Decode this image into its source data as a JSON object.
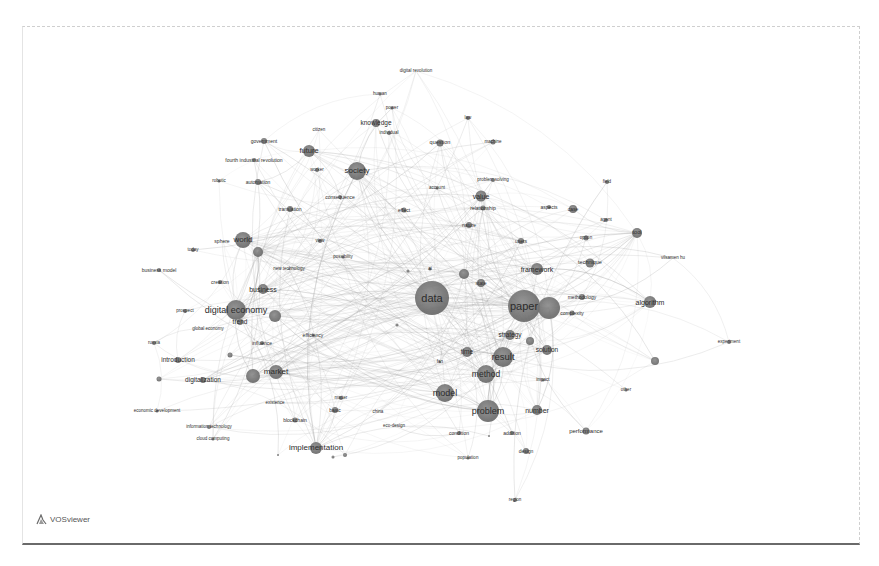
{
  "app": {
    "logo_text": "VOSviewer"
  },
  "network": {
    "nodes": [
      {
        "label": "digital revolution",
        "x": 416,
        "y": 71,
        "r": 0,
        "fs": 4.5
      },
      {
        "label": "human",
        "x": 380,
        "y": 94,
        "r": 1.5,
        "fs": 4.5
      },
      {
        "label": "power",
        "x": 392,
        "y": 108,
        "r": 1.5,
        "fs": 4.5
      },
      {
        "label": "law",
        "x": 468,
        "y": 118,
        "r": 2,
        "fs": 4.5
      },
      {
        "label": "knowledge",
        "x": 376,
        "y": 123,
        "r": 4,
        "fs": 6.5
      },
      {
        "label": "individual",
        "x": 389,
        "y": 133,
        "r": 2,
        "fs": 4.5
      },
      {
        "label": "citizen",
        "x": 319,
        "y": 130,
        "r": 0,
        "fs": 4.5
      },
      {
        "label": "government",
        "x": 264,
        "y": 141,
        "r": 3,
        "fs": 5
      },
      {
        "label": "question",
        "x": 440,
        "y": 143,
        "r": 3.5,
        "fs": 5.5
      },
      {
        "label": "machine",
        "x": 493,
        "y": 142,
        "r": 2.5,
        "fs": 4.5
      },
      {
        "label": "future",
        "x": 309,
        "y": 151,
        "r": 6,
        "fs": 7.5
      },
      {
        "label": "fourth industrial revolution",
        "x": 254,
        "y": 160,
        "r": 2,
        "fs": 5
      },
      {
        "label": "society",
        "x": 357,
        "y": 171,
        "r": 9,
        "fs": 8
      },
      {
        "label": "worker",
        "x": 317,
        "y": 170,
        "r": 2,
        "fs": 4.5
      },
      {
        "label": "robotic",
        "x": 219,
        "y": 181,
        "r": 1.5,
        "fs": 4.5
      },
      {
        "label": "automation",
        "x": 258,
        "y": 182,
        "r": 3,
        "fs": 5
      },
      {
        "label": "account",
        "x": 437,
        "y": 188,
        "r": 1.5,
        "fs": 4.5
      },
      {
        "label": "problem solving",
        "x": 493,
        "y": 180,
        "r": 2,
        "fs": 4.5
      },
      {
        "label": "consequence",
        "x": 340,
        "y": 197,
        "r": 2,
        "fs": 5
      },
      {
        "label": "value",
        "x": 481,
        "y": 196,
        "r": 5.5,
        "fs": 7
      },
      {
        "label": "relationship",
        "x": 483,
        "y": 208,
        "r": 2.5,
        "fs": 5
      },
      {
        "label": "effect",
        "x": 404,
        "y": 210,
        "r": 2.5,
        "fs": 5
      },
      {
        "label": "translation",
        "x": 290,
        "y": 209,
        "r": 3,
        "fs": 5
      },
      {
        "label": "aspects",
        "x": 549,
        "y": 207,
        "r": 2,
        "fs": 5
      },
      {
        "label": "case",
        "x": 573,
        "y": 209,
        "r": 4,
        "fs": 5
      },
      {
        "label": "field",
        "x": 607,
        "y": 182,
        "r": 2,
        "fs": 4.5
      },
      {
        "label": "agent",
        "x": 606,
        "y": 220,
        "r": 2,
        "fs": 4.5
      },
      {
        "label": "nature",
        "x": 469,
        "y": 225,
        "r": 3,
        "fs": 5
      },
      {
        "label": "world",
        "x": 243,
        "y": 240,
        "r": 8,
        "fs": 8
      },
      {
        "label": "sphere",
        "x": 222,
        "y": 241,
        "r": 0,
        "fs": 5
      },
      {
        "label": "today",
        "x": 193,
        "y": 250,
        "r": 2,
        "fs": 4.5
      },
      {
        "label": "",
        "x": 258,
        "y": 252,
        "r": 5,
        "fs": 0
      },
      {
        "label": "view",
        "x": 320,
        "y": 241,
        "r": 2,
        "fs": 4.5
      },
      {
        "label": "users",
        "x": 521,
        "y": 241,
        "r": 3,
        "fs": 5
      },
      {
        "label": "option",
        "x": 586,
        "y": 238,
        "r": 2.5,
        "fs": 4.5
      },
      {
        "label": "tool",
        "x": 637,
        "y": 233,
        "r": 5,
        "fs": 5.5
      },
      {
        "label": "possibility",
        "x": 343,
        "y": 257,
        "r": 1.5,
        "fs": 4.5
      },
      {
        "label": "vilsamen hu",
        "x": 673,
        "y": 258,
        "r": 0,
        "fs": 4.5
      },
      {
        "label": "technique",
        "x": 590,
        "y": 263,
        "r": 4.5,
        "fs": 5.5
      },
      {
        "label": "framework",
        "x": 537,
        "y": 269,
        "r": 6,
        "fs": 7
      },
      {
        "label": "business model",
        "x": 159,
        "y": 270,
        "r": 2,
        "fs": 5
      },
      {
        "label": "new technology",
        "x": 289,
        "y": 269,
        "r": 1,
        "fs": 4.5
      },
      {
        "label": "",
        "x": 408,
        "y": 271,
        "r": 1.5,
        "fs": 0
      },
      {
        "label": "",
        "x": 464,
        "y": 274,
        "r": 5,
        "fs": 0
      },
      {
        "label": "ai",
        "x": 430,
        "y": 269,
        "r": 1.5,
        "fs": 4.5
      },
      {
        "label": "creation",
        "x": 220,
        "y": 282,
        "r": 2,
        "fs": 5
      },
      {
        "label": "state",
        "x": 481,
        "y": 283,
        "r": 4,
        "fs": 5
      },
      {
        "label": "business",
        "x": 263,
        "y": 289,
        "r": 5,
        "fs": 7
      },
      {
        "label": "data",
        "x": 432,
        "y": 298,
        "r": 17,
        "fs": 11
      },
      {
        "label": "paper",
        "x": 524,
        "y": 306,
        "r": 16,
        "fs": 11
      },
      {
        "label": "",
        "x": 549,
        "y": 308,
        "r": 11,
        "fs": 0
      },
      {
        "label": "methodology",
        "x": 582,
        "y": 297,
        "r": 3,
        "fs": 5
      },
      {
        "label": "complexity",
        "x": 572,
        "y": 313,
        "r": 2.5,
        "fs": 5
      },
      {
        "label": "algorithm",
        "x": 650,
        "y": 302,
        "r": 6,
        "fs": 7
      },
      {
        "label": "digital economy",
        "x": 236,
        "y": 310,
        "r": 10,
        "fs": 9
      },
      {
        "label": "",
        "x": 275,
        "y": 316,
        "r": 6,
        "fs": 0
      },
      {
        "label": "prospect",
        "x": 185,
        "y": 311,
        "r": 2,
        "fs": 4.5
      },
      {
        "label": "trend",
        "x": 240,
        "y": 322,
        "r": 3,
        "fs": 6.5
      },
      {
        "label": "global economy",
        "x": 208,
        "y": 329,
        "r": 0,
        "fs": 4.5
      },
      {
        "label": "",
        "x": 397,
        "y": 325,
        "r": 1.5,
        "fs": 0
      },
      {
        "label": "strategy",
        "x": 510,
        "y": 335,
        "r": 5,
        "fs": 6.5
      },
      {
        "label": "efficiency",
        "x": 313,
        "y": 335,
        "r": 1.5,
        "fs": 5
      },
      {
        "label": "influence",
        "x": 262,
        "y": 343,
        "r": 2,
        "fs": 5
      },
      {
        "label": "russia",
        "x": 154,
        "y": 343,
        "r": 2,
        "fs": 4.5
      },
      {
        "label": "",
        "x": 530,
        "y": 341,
        "r": 4,
        "fs": 0
      },
      {
        "label": "solution",
        "x": 547,
        "y": 350,
        "r": 5,
        "fs": 6.5
      },
      {
        "label": "time",
        "x": 467,
        "y": 352,
        "r": 5,
        "fs": 6.5
      },
      {
        "label": "result",
        "x": 503,
        "y": 357,
        "r": 10,
        "fs": 9.5
      },
      {
        "label": "introduction",
        "x": 178,
        "y": 360,
        "r": 3,
        "fs": 6.5
      },
      {
        "label": "",
        "x": 230,
        "y": 355,
        "r": 2.5,
        "fs": 0
      },
      {
        "label": "experiment",
        "x": 729,
        "y": 342,
        "r": 2,
        "fs": 4.5
      },
      {
        "label": "fan",
        "x": 440,
        "y": 362,
        "r": 1,
        "fs": 4.5
      },
      {
        "label": "tool2",
        "x": 655,
        "y": 361,
        "r": 4,
        "fs": 0
      },
      {
        "label": "method",
        "x": 486,
        "y": 374,
        "r": 9,
        "fs": 8.5
      },
      {
        "label": "market",
        "x": 276,
        "y": 372,
        "r": 7,
        "fs": 8
      },
      {
        "label": "",
        "x": 253,
        "y": 376,
        "r": 7,
        "fs": 0
      },
      {
        "label": "digitalization",
        "x": 203,
        "y": 380,
        "r": 3,
        "fs": 6.5
      },
      {
        "label": "",
        "x": 159,
        "y": 379,
        "r": 2.5,
        "fs": 0
      },
      {
        "label": "impact",
        "x": 543,
        "y": 380,
        "r": 1.5,
        "fs": 4.5
      },
      {
        "label": "other",
        "x": 626,
        "y": 390,
        "r": 1.5,
        "fs": 4.5
      },
      {
        "label": "model",
        "x": 445,
        "y": 393,
        "r": 9,
        "fs": 9
      },
      {
        "label": "economic development",
        "x": 157,
        "y": 411,
        "r": 1.5,
        "fs": 4.5
      },
      {
        "label": "existence",
        "x": 275,
        "y": 403,
        "r": 0,
        "fs": 4.5
      },
      {
        "label": "number",
        "x": 537,
        "y": 410,
        "r": 5,
        "fs": 7
      },
      {
        "label": "problem",
        "x": 488,
        "y": 411,
        "r": 11,
        "fs": 9
      },
      {
        "label": "basic",
        "x": 335,
        "y": 410,
        "r": 3,
        "fs": 5
      },
      {
        "label": "matter",
        "x": 341,
        "y": 398,
        "r": 2,
        "fs": 4.5
      },
      {
        "label": "china",
        "x": 378,
        "y": 412,
        "r": 0,
        "fs": 4.5
      },
      {
        "label": "blockchain",
        "x": 295,
        "y": 420,
        "r": 2.5,
        "fs": 5
      },
      {
        "label": "information technology",
        "x": 209,
        "y": 427,
        "r": 2,
        "fs": 4.5
      },
      {
        "label": "eco-design",
        "x": 394,
        "y": 426,
        "r": 0,
        "fs": 4.5
      },
      {
        "label": "performance",
        "x": 586,
        "y": 431,
        "r": 3.5,
        "fs": 6
      },
      {
        "label": "condition",
        "x": 459,
        "y": 433,
        "r": 2,
        "fs": 5
      },
      {
        "label": "addition",
        "x": 512,
        "y": 433,
        "r": 2,
        "fs": 5
      },
      {
        "label": "",
        "x": 489,
        "y": 436,
        "r": 1,
        "fs": 0
      },
      {
        "label": "cloud computing",
        "x": 213,
        "y": 439,
        "r": 1.5,
        "fs": 4.5
      },
      {
        "label": "design",
        "x": 526,
        "y": 451,
        "r": 3,
        "fs": 5
      },
      {
        "label": "implementation",
        "x": 316,
        "y": 448,
        "r": 6,
        "fs": 8
      },
      {
        "label": "",
        "x": 345,
        "y": 455,
        "r": 2,
        "fs": 0
      },
      {
        "label": "",
        "x": 333,
        "y": 457,
        "r": 1.5,
        "fs": 0
      },
      {
        "label": "",
        "x": 278,
        "y": 455,
        "r": 1,
        "fs": 0
      },
      {
        "label": "population",
        "x": 468,
        "y": 458,
        "r": 1.5,
        "fs": 4.5
      },
      {
        "label": "region",
        "x": 515,
        "y": 500,
        "r": 2,
        "fs": 4.5
      }
    ]
  }
}
